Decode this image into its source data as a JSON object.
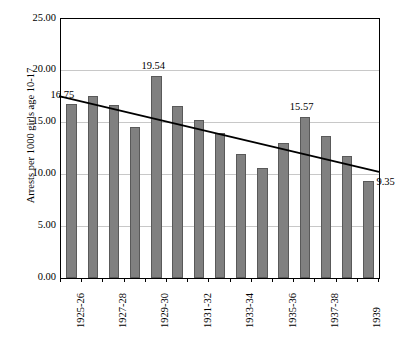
{
  "chart_data": {
    "type": "bar",
    "title": "",
    "xlabel": "",
    "ylabel": "Arrests per 1000 girls age 10-17",
    "ylim": [
      0,
      25
    ],
    "ytick_labels": [
      "0.00",
      "5.00",
      "10.00",
      "15.00",
      "20.00",
      "25.00"
    ],
    "ytick_values": [
      0,
      5,
      10,
      15,
      20,
      25
    ],
    "grid": true,
    "legend": "none",
    "categories": [
      "1925",
      "1926",
      "1927",
      "1928",
      "1929",
      "1930",
      "1931",
      "1932",
      "1933",
      "1934",
      "1935",
      "1936",
      "1937",
      "1938",
      "1939"
    ],
    "xtick_labels": [
      "1925-26",
      "",
      "1927-28",
      "",
      "1929-30",
      "",
      "1931-32",
      "",
      "1933-34",
      "",
      "1935-36",
      "",
      "1937-38",
      "",
      "1939"
    ],
    "values": [
      16.75,
      17.55,
      16.7,
      14.6,
      19.54,
      16.6,
      15.3,
      14.0,
      12.0,
      10.6,
      13.0,
      15.57,
      13.75,
      11.75,
      9.35
    ],
    "annotations": [
      {
        "label": "16.75",
        "index": 0,
        "value": 16.75
      },
      {
        "label": "19.54",
        "index": 4,
        "value": 19.54
      },
      {
        "label": "15.57",
        "index": 11,
        "value": 15.57
      },
      {
        "label": "9.35",
        "index": 14,
        "value": 9.35
      }
    ],
    "trendline": {
      "type": "linear",
      "start_value": 17.45,
      "end_value": 10.15,
      "color": "#000000"
    },
    "colors": {
      "bar_fill": "#808080",
      "bar_edge": "#595959",
      "gridline": "#c8c8c8",
      "axis": "#000000",
      "background": "#ffffff"
    }
  }
}
